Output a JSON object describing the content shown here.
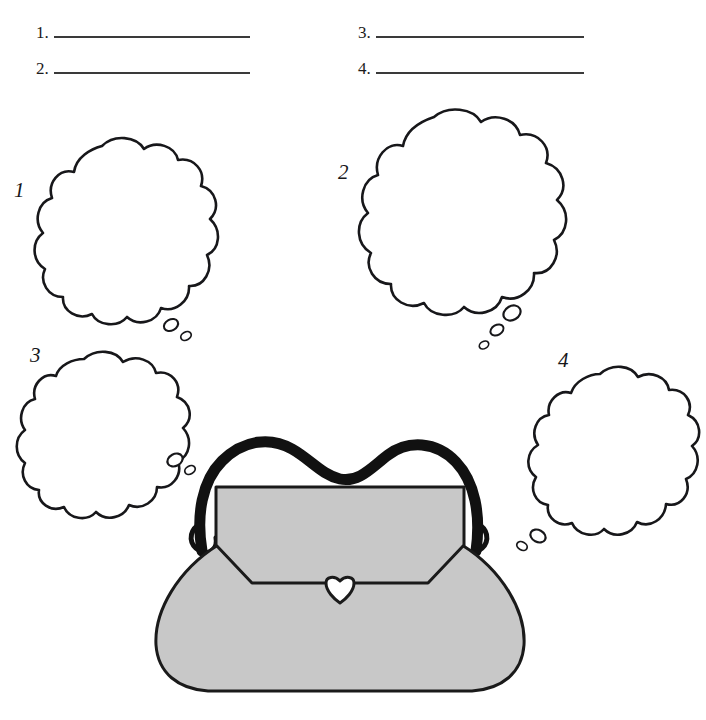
{
  "page": {
    "background_color": "#ffffff",
    "ink_color": "#17171a",
    "purse_fill_color": "#c8c8c8",
    "rule_color": "#3a3a3a"
  },
  "answers": {
    "items": [
      {
        "number": "1.",
        "value": "",
        "line_width": 196
      },
      {
        "number": "2.",
        "value": "",
        "line_width": 196
      },
      {
        "number": "3.",
        "value": "",
        "line_width": 208
      },
      {
        "number": "4.",
        "value": "",
        "line_width": 208
      }
    ]
  },
  "bubbles": [
    {
      "label": "1",
      "value": "",
      "tail_dots": 2
    },
    {
      "label": "2",
      "value": "",
      "tail_dots": 3
    },
    {
      "label": "3",
      "value": "",
      "tail_dots": 2
    },
    {
      "label": "4",
      "value": "",
      "tail_dots": 2
    }
  ],
  "purse": {
    "name": "handbag",
    "handle_label": "handle",
    "flap_label": "flap",
    "clasp_label": "clasp",
    "body_label": "body"
  }
}
